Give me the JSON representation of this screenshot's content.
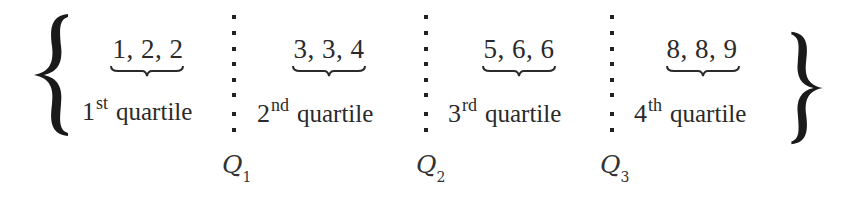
{
  "diagram": {
    "title": "",
    "groups": [
      {
        "values": "1, 2, 2",
        "ordinal": "1",
        "suffix": "st",
        "label": "quartile"
      },
      {
        "values": "3, 3, 4",
        "ordinal": "2",
        "suffix": "nd",
        "label": "quartile"
      },
      {
        "values": "5, 6, 6",
        "ordinal": "3",
        "suffix": "rd",
        "label": "quartile"
      },
      {
        "values": "8, 8, 9",
        "ordinal": "4",
        "suffix": "th",
        "label": "quartile"
      }
    ],
    "dividers": [
      {
        "symbol": "Q",
        "index": "1"
      },
      {
        "symbol": "Q",
        "index": "2"
      },
      {
        "symbol": "Q",
        "index": "3"
      }
    ],
    "colors": {
      "ink": "#222222",
      "background": "#ffffff"
    }
  }
}
